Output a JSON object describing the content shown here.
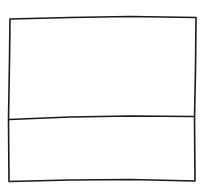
{
  "sketch": {
    "description": "Hand-drawn wireframe: rectangle split into two stacked panels",
    "stroke_color": "#1a1a1a",
    "background_color": "#ffffff",
    "panels": [
      {
        "name": "top-panel",
        "label": ""
      },
      {
        "name": "bottom-panel",
        "label": ""
      }
    ]
  }
}
